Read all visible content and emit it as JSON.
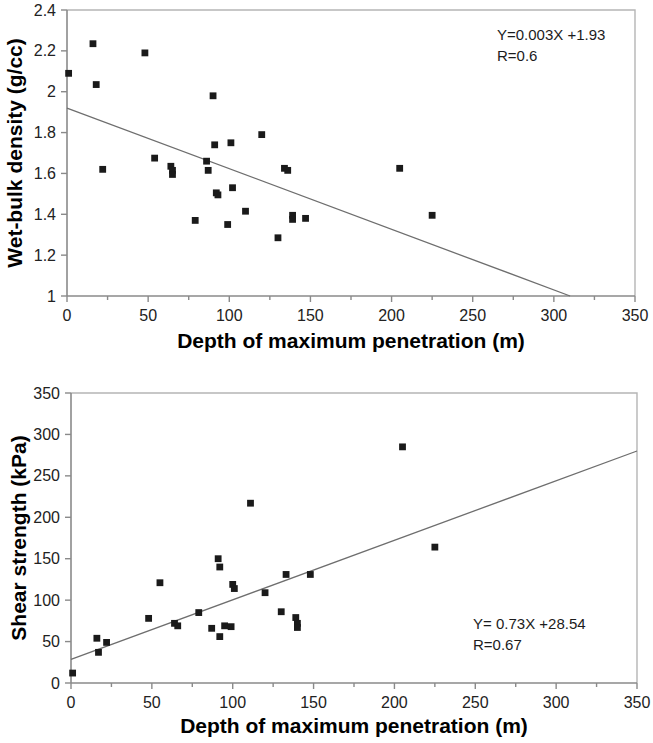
{
  "page": {
    "background_color": "#ffffff",
    "marker_color": "#1a1a1a",
    "axis_color": "#8a8a8a",
    "trendline_color": "#6e6e6e"
  },
  "charts": [
    {
      "id": "wet-bulk-density",
      "chart_data": {
        "type": "scatter",
        "title": "",
        "xlabel": "Depth of maximum penetration (m)",
        "ylabel": "Wet-bulk density (g/cc)",
        "xlim": [
          0,
          350
        ],
        "ylim": [
          1,
          2.4
        ],
        "xticks": [
          0,
          50,
          100,
          150,
          200,
          250,
          300,
          350
        ],
        "yticks": [
          1,
          1.2,
          1.4,
          1.6,
          1.8,
          2,
          2.2,
          2.4
        ],
        "xtick_labels": [
          "0",
          "50",
          "100",
          "150",
          "200",
          "250",
          "300",
          "350"
        ],
        "ytick_labels": [
          "1",
          "1.2",
          "1.4",
          "1.6",
          "1.8",
          "2",
          "2.2",
          "2.4"
        ],
        "grid": false,
        "legend": null,
        "annotations": [
          "Y=0.003X +1.93",
          "R=0.6"
        ],
        "equation": "Y=0.003X +1.93",
        "correlation": "R=0.6",
        "trendline": {
          "x": [
            0,
            310
          ],
          "y": [
            1.92,
            1.0
          ]
        },
        "series": [
          {
            "name": "Wet-bulk density",
            "points": [
              [
                1,
                2.09
              ],
              [
                16,
                2.235
              ],
              [
                18,
                2.035
              ],
              [
                22,
                1.62
              ],
              [
                48,
                2.19
              ],
              [
                54,
                1.675
              ],
              [
                64,
                1.635
              ],
              [
                65,
                1.615
              ],
              [
                65,
                1.595
              ],
              [
                79,
                1.37
              ],
              [
                86,
                1.66
              ],
              [
                87,
                1.615
              ],
              [
                90,
                1.98
              ],
              [
                91,
                1.74
              ],
              [
                92,
                1.505
              ],
              [
                93,
                1.495
              ],
              [
                99,
                1.35
              ],
              [
                101,
                1.75
              ],
              [
                102,
                1.53
              ],
              [
                110,
                1.415
              ],
              [
                120,
                1.79
              ],
              [
                130,
                1.285
              ],
              [
                134,
                1.625
              ],
              [
                136,
                1.615
              ],
              [
                139,
                1.395
              ],
              [
                139,
                1.375
              ],
              [
                147,
                1.38
              ],
              [
                205,
                1.625
              ],
              [
                225,
                1.395
              ]
            ]
          }
        ]
      }
    },
    {
      "id": "shear-strength",
      "chart_data": {
        "type": "scatter",
        "title": "",
        "xlabel": "Depth of maximum penetration (m)",
        "ylabel": "Shear strength (kPa)",
        "xlim": [
          0,
          350
        ],
        "ylim": [
          0,
          350
        ],
        "xticks": [
          0,
          50,
          100,
          150,
          200,
          250,
          300,
          350
        ],
        "yticks": [
          0,
          50,
          100,
          150,
          200,
          250,
          300,
          350
        ],
        "xtick_labels": [
          "0",
          "50",
          "100",
          "150",
          "200",
          "250",
          "300",
          "350"
        ],
        "ytick_labels": [
          "0",
          "50",
          "100",
          "150",
          "200",
          "250",
          "300",
          "350"
        ],
        "grid": false,
        "legend": null,
        "annotations": [
          "Y= 0.73X +28.54",
          "R=0.67"
        ],
        "equation": "Y= 0.73X +28.54",
        "correlation": "R=0.67",
        "trendline": {
          "x": [
            0,
            350
          ],
          "y": [
            28.54,
            280
          ]
        },
        "series": [
          {
            "name": "Shear strength",
            "points": [
              [
                1,
                12
              ],
              [
                16,
                54
              ],
              [
                17,
                37
              ],
              [
                22,
                49
              ],
              [
                48,
                78
              ],
              [
                55,
                121
              ],
              [
                64,
                72
              ],
              [
                66,
                69
              ],
              [
                79,
                85
              ],
              [
                87,
                66
              ],
              [
                91,
                150
              ],
              [
                92,
                140
              ],
              [
                92,
                56
              ],
              [
                95,
                69
              ],
              [
                99,
                68
              ],
              [
                100,
                119
              ],
              [
                101,
                114
              ],
              [
                111,
                217
              ],
              [
                120,
                109
              ],
              [
                130,
                86
              ],
              [
                133,
                131
              ],
              [
                139,
                79
              ],
              [
                140,
                72
              ],
              [
                140,
                67
              ],
              [
                148,
                131
              ],
              [
                205,
                285
              ],
              [
                225,
                164
              ]
            ]
          }
        ]
      }
    }
  ]
}
